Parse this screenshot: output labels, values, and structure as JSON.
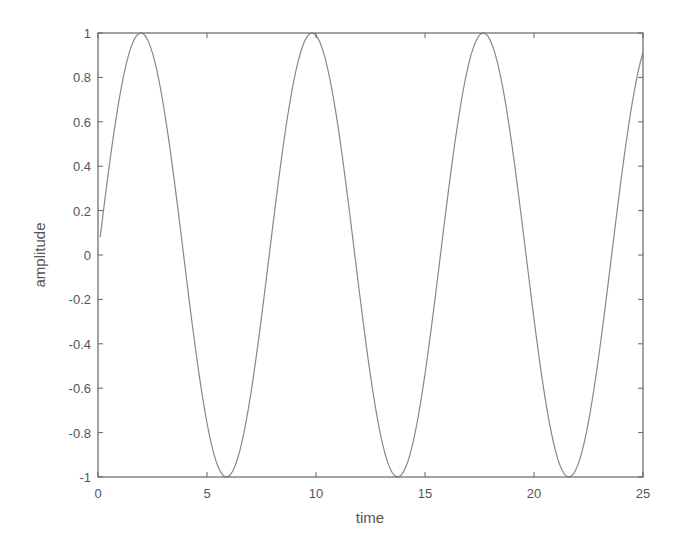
{
  "chart_data": {
    "type": "line",
    "title": "",
    "xlabel": "time",
    "ylabel": "amplitude",
    "xlim": [
      0,
      25
    ],
    "ylim": [
      -1,
      1
    ],
    "xticks": [
      0,
      5,
      10,
      15,
      20,
      25
    ],
    "yticks": [
      -1,
      -0.8,
      -0.6,
      -0.4,
      -0.2,
      0,
      0.2,
      0.4,
      0.6,
      0.8,
      1
    ],
    "xtick_labels": [
      "0",
      "5",
      "10",
      "15",
      "20",
      "25"
    ],
    "ytick_labels": [
      "-1",
      "-0.8",
      "-0.6",
      "-0.4",
      "-0.2",
      "0",
      "0.2",
      "0.4",
      "0.6",
      "0.8",
      "1"
    ],
    "grid": false,
    "legend": null,
    "series": [
      {
        "name": "amplitude",
        "function": "sin(0.8*t)",
        "color": "#888888",
        "x_start": 0.1,
        "x_end": 25,
        "x_step": 0.1,
        "key_points": [
          {
            "x": 0,
            "y": 0.05
          },
          {
            "x": 1.96,
            "y": 1
          },
          {
            "x": 5.89,
            "y": -1
          },
          {
            "x": 9.82,
            "y": 1
          },
          {
            "x": 13.74,
            "y": -1
          },
          {
            "x": 17.67,
            "y": 1
          },
          {
            "x": 21.6,
            "y": -1
          },
          {
            "x": 25,
            "y": 0.91
          }
        ]
      }
    ]
  },
  "colors": {
    "axes": "#666666",
    "line": "#8a8a8a",
    "text": "#555555",
    "background": "#ffffff"
  }
}
